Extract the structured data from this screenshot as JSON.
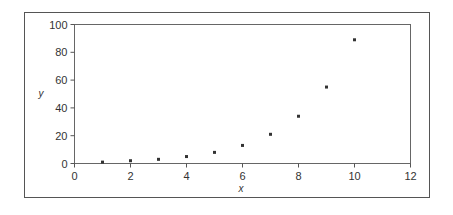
{
  "chart_data": {
    "type": "scatter",
    "title": "",
    "xlabel": "x",
    "ylabel": "y",
    "xlim": [
      0,
      12
    ],
    "ylim": [
      0,
      100
    ],
    "xticks": [
      0,
      2,
      4,
      6,
      8,
      10,
      12
    ],
    "yticks": [
      0,
      20,
      40,
      60,
      80,
      100
    ],
    "grid": false,
    "legend": null,
    "series": [
      {
        "name": "series1",
        "x": [
          1,
          2,
          3,
          4,
          5,
          6,
          7,
          8,
          9,
          10
        ],
        "y": [
          1,
          2,
          3,
          5,
          8,
          13,
          21,
          34,
          55,
          89
        ]
      }
    ]
  },
  "colors": {
    "marker": "#333333",
    "axis": "#555555",
    "frame": "#555555",
    "background": "#ffffff"
  }
}
